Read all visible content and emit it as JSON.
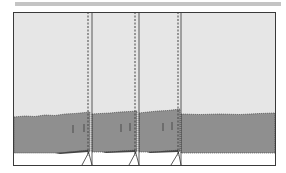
{
  "figure": {
    "colors": {
      "top_bar": "#c4c4c4",
      "upper_area": "#e6e6e6",
      "lower_band": "#8f8f8f",
      "frame": "#3a3a3a",
      "base": "#ffffff"
    },
    "frame": {
      "x": 13,
      "y": 12,
      "width": 263,
      "height": 154
    },
    "fold_lines": [
      {
        "dashed_x": 88,
        "solid_x": 92
      },
      {
        "dashed_x": 135,
        "solid_x": 139
      },
      {
        "dashed_x": 178,
        "solid_x": 181
      }
    ],
    "band": {
      "top_y": 113,
      "bottom_y": 155
    },
    "panels": 4
  }
}
